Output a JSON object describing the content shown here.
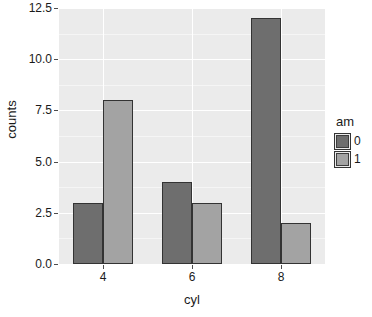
{
  "chart_data": {
    "type": "bar",
    "title": "",
    "subtitle": "",
    "xlabel": "cyl",
    "ylabel": "counts",
    "categories": [
      "4",
      "6",
      "8"
    ],
    "series": [
      {
        "name": "0",
        "color": "#6e6e6e",
        "values": [
          3,
          4,
          12
        ]
      },
      {
        "name": "1",
        "color": "#a3a3a3",
        "values": [
          8,
          3,
          2
        ]
      }
    ],
    "legend": {
      "title": "am",
      "position": "right",
      "entries": [
        {
          "label": "0",
          "color": "#6e6e6e"
        },
        {
          "label": "1",
          "color": "#a3a3a3"
        }
      ]
    },
    "ylim": [
      0,
      12.5
    ],
    "y_ticks": [
      0.0,
      2.5,
      5.0,
      7.5,
      10.0,
      12.5
    ],
    "y_tick_labels": [
      "0.0",
      "2.5",
      "5.0",
      "7.5",
      "10.0",
      "12.5"
    ],
    "y_minor_ticks": [
      1.25,
      3.75,
      6.25,
      8.75,
      11.25
    ],
    "x_tick_labels": [
      "4",
      "6",
      "8"
    ],
    "grid": true,
    "panel_background": "#ebebeb",
    "grid_major_color": "#ffffff",
    "grid_minor_color": "#f5f5f5",
    "bar_border_color": "#333333",
    "dodge": true
  }
}
